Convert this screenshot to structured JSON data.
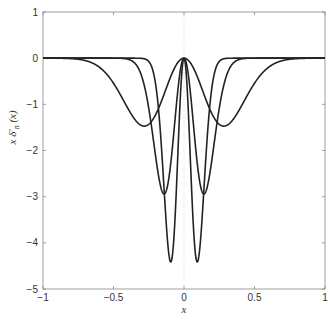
{
  "chart_data": {
    "type": "line",
    "title": "",
    "xlabel": "x",
    "ylabel": "x δ′_n (x)",
    "xlim": [
      -1,
      1
    ],
    "ylim": [
      -5,
      1
    ],
    "xticks": [
      "-1",
      "-0.5",
      "0",
      "0.5",
      "1"
    ],
    "yticks": [
      "1",
      "0",
      "-1",
      "-2",
      "-3",
      "-4",
      "-5"
    ],
    "grid": false,
    "legend": null,
    "series": [
      {
        "name": "n1",
        "n": 3.545,
        "min_value": -1.47,
        "min_x": [
          -0.28,
          0.28
        ]
      },
      {
        "name": "n2",
        "n": 7.09,
        "min_value": -2.94,
        "min_x": [
          -0.14,
          0.14
        ]
      },
      {
        "name": "n3",
        "n": 10.63,
        "min_value": -4.41,
        "min_x": [
          -0.094,
          0.094
        ]
      }
    ],
    "annotations": [
      "dotted vertical line at x=0"
    ]
  },
  "axes": {
    "xlabel": "x",
    "ylabel_main": "x δ′",
    "ylabel_sub": "n",
    "ylabel_arg": "(x)"
  }
}
